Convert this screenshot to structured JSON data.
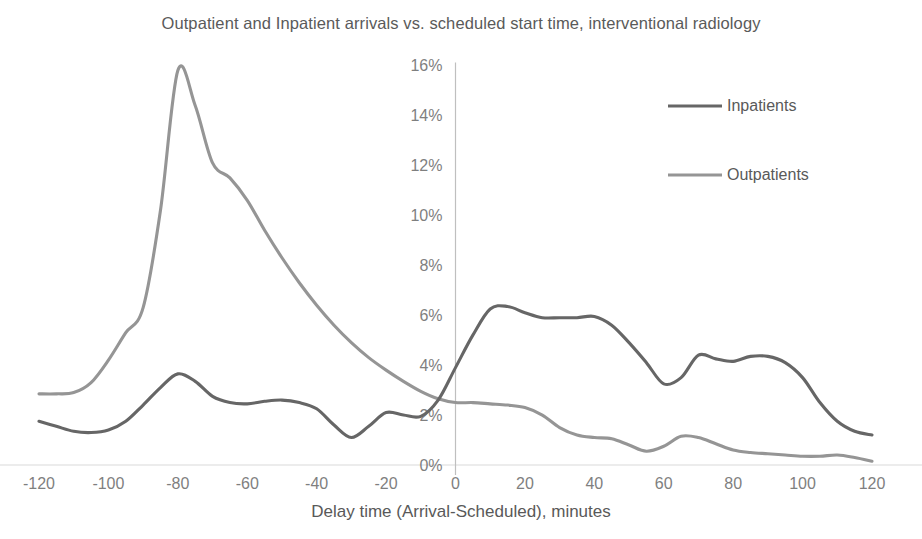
{
  "chart_data": {
    "type": "line",
    "title": "Outpatient and Inpatient arrivals vs. scheduled start time, interventional radiology",
    "xlabel": "Delay time (Arrival-Scheduled), minutes",
    "ylabel": "",
    "xlim": [
      -120,
      120
    ],
    "ylim": [
      0,
      16
    ],
    "xticks": [
      -120,
      -100,
      -80,
      -60,
      -40,
      -20,
      0,
      20,
      40,
      60,
      80,
      100,
      120
    ],
    "xtick_labels": [
      "-120",
      "-100",
      "-80",
      "-60",
      "-40",
      "-20",
      "0",
      "20",
      "40",
      "60",
      "80",
      "100",
      "120"
    ],
    "yticks": [
      0,
      2,
      4,
      6,
      8,
      10,
      12,
      14,
      16
    ],
    "ytick_labels": [
      "0%",
      "2%",
      "4%",
      "6%",
      "8%",
      "10%",
      "12%",
      "14%",
      "16%"
    ],
    "grid": "horizontal",
    "legend_position": "upper-right-inside",
    "x": [
      -120,
      -115,
      -110,
      -105,
      -100,
      -95,
      -90,
      -85,
      -80,
      -75,
      -70,
      -65,
      -60,
      -55,
      -50,
      -45,
      -40,
      -35,
      -30,
      -25,
      -20,
      -15,
      -10,
      -5,
      0,
      5,
      10,
      15,
      20,
      25,
      30,
      35,
      40,
      45,
      50,
      55,
      60,
      65,
      70,
      75,
      80,
      85,
      90,
      95,
      100,
      105,
      110,
      115,
      120
    ],
    "series": [
      {
        "name": "Inpatients",
        "color": "#666666",
        "values": [
          1.75,
          1.55,
          1.35,
          1.3,
          1.4,
          1.75,
          2.4,
          3.1,
          3.65,
          3.35,
          2.75,
          2.5,
          2.45,
          2.55,
          2.6,
          2.5,
          2.25,
          1.6,
          1.1,
          1.55,
          2.1,
          2.0,
          1.95,
          2.6,
          3.9,
          5.2,
          6.25,
          6.35,
          6.1,
          5.9,
          5.9,
          5.9,
          5.95,
          5.6,
          4.9,
          4.1,
          3.25,
          3.5,
          4.4,
          4.25,
          4.15,
          4.35,
          4.35,
          4.1,
          3.5,
          2.5,
          1.75,
          1.35,
          1.2
        ]
      },
      {
        "name": "Outpatients",
        "color": "#959595",
        "values": [
          2.85,
          2.85,
          2.9,
          3.3,
          4.2,
          5.3,
          6.3,
          10.2,
          15.8,
          14.4,
          12.1,
          11.5,
          10.6,
          9.4,
          8.3,
          7.3,
          6.4,
          5.6,
          4.9,
          4.3,
          3.8,
          3.35,
          2.95,
          2.65,
          2.5,
          2.5,
          2.45,
          2.4,
          2.3,
          2.0,
          1.5,
          1.2,
          1.1,
          1.05,
          0.8,
          0.55,
          0.75,
          1.15,
          1.1,
          0.85,
          0.6,
          0.5,
          0.45,
          0.4,
          0.35,
          0.35,
          0.4,
          0.3,
          0.15
        ]
      }
    ]
  },
  "legend": {
    "items": [
      {
        "label": "Inpatients",
        "color": "#666666"
      },
      {
        "label": "Outpatients",
        "color": "#959595"
      }
    ]
  }
}
